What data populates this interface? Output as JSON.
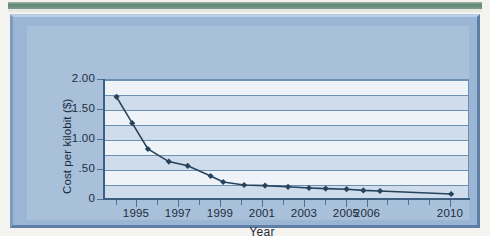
{
  "figure": {
    "frame_color": "#9bb5d4",
    "panel_color": "#a8c0da",
    "plot_bg_color": "#cfdcec",
    "band_color": "#eef3f9",
    "grid_color": "#6d8fb2",
    "axis_color": "#3f5f80",
    "series_color": "#27435c",
    "top_bar_color": "#5e8874"
  },
  "chart_data": {
    "type": "line",
    "title": "",
    "subtitle": "",
    "xlabel": "Year",
    "ylabel": "Cost per kilobit ($)",
    "xlim": [
      1993.4,
      2010.9
    ],
    "ylim": [
      0,
      2.0
    ],
    "grid": true,
    "grid_interval": 0.25,
    "legend": "none",
    "marker": "diamond",
    "y_ticks": [
      {
        "value": 2.0,
        "label": "2.00"
      },
      {
        "value": 1.5,
        "label": "1.50"
      },
      {
        "value": 1.0,
        "label": "1.00"
      },
      {
        "value": 0.5,
        "label": ".50"
      },
      {
        "value": 0.0,
        "label": "0"
      }
    ],
    "x_ticks": [
      {
        "value": 1995,
        "label": "1995"
      },
      {
        "value": 1997,
        "label": "1997"
      },
      {
        "value": 1999,
        "label": "1999"
      },
      {
        "value": 2001,
        "label": "2001"
      },
      {
        "value": 2003,
        "label": "2003"
      },
      {
        "value": 2005,
        "label": "2005"
      },
      {
        "value": 2006,
        "label": "2006"
      },
      {
        "value": 2010,
        "label": "2010"
      }
    ],
    "x": [
      1994.0,
      1994.75,
      1995.5,
      1996.5,
      1997.4,
      1998.5,
      1999.1,
      2000.1,
      2001.1,
      2002.2,
      2003.2,
      2004.0,
      2005.0,
      2005.8,
      2006.6,
      2010.0
    ],
    "values": [
      1.72,
      1.28,
      0.85,
      0.64,
      0.57,
      0.4,
      0.3,
      0.25,
      0.24,
      0.22,
      0.2,
      0.19,
      0.18,
      0.16,
      0.15,
      0.1
    ],
    "series": [
      {
        "name": "Cost per kilobit",
        "values": [
          1.72,
          1.28,
          0.85,
          0.64,
          0.57,
          0.4,
          0.3,
          0.25,
          0.24,
          0.22,
          0.2,
          0.19,
          0.18,
          0.16,
          0.15,
          0.1
        ]
      }
    ]
  }
}
